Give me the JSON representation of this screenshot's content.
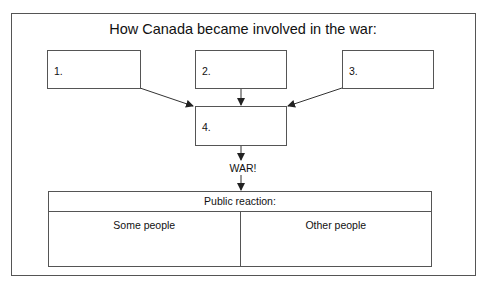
{
  "title": "How Canada became involved in the war:",
  "boxes": [
    {
      "label": "1."
    },
    {
      "label": "2."
    },
    {
      "label": "3."
    },
    {
      "label": "4."
    }
  ],
  "outcome": "WAR!",
  "reaction": {
    "header": "Public reaction:",
    "columns": [
      "Some people",
      "Other people"
    ]
  },
  "colors": {
    "line": "#555555",
    "text": "#111111",
    "background": "#ffffff"
  }
}
